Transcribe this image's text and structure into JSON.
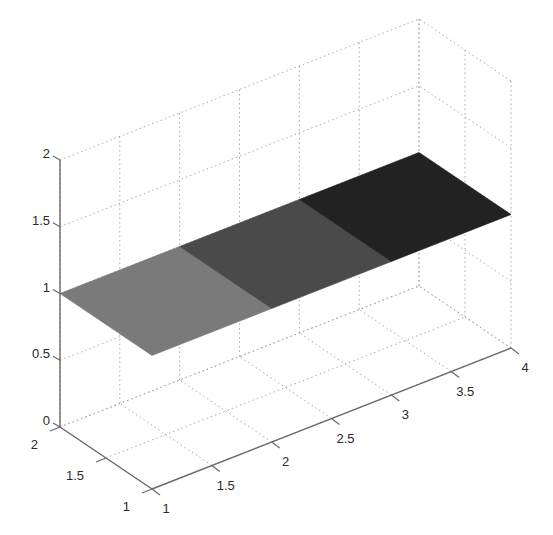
{
  "chart_data": {
    "type": "surface3d",
    "title": "",
    "xlabel": "",
    "ylabel": "",
    "zlabel": "",
    "grid": true,
    "legend": null,
    "x": [
      1,
      2,
      3,
      4
    ],
    "y": [
      1,
      2
    ],
    "z": [
      [
        1,
        1,
        1,
        1
      ],
      [
        1,
        1,
        1,
        1
      ]
    ],
    "patches": [
      {
        "x_range": [
          1,
          2
        ],
        "y_range": [
          1,
          2
        ],
        "z": 1,
        "color": "#7a7a7a"
      },
      {
        "x_range": [
          2,
          3
        ],
        "y_range": [
          1,
          2
        ],
        "z": 1,
        "color": "#4a4a4a"
      },
      {
        "x_range": [
          3,
          4
        ],
        "y_range": [
          1,
          2
        ],
        "z": 1,
        "color": "#222222"
      }
    ],
    "xlim": [
      1,
      4
    ],
    "ylim": [
      1,
      2
    ],
    "zlim": [
      0,
      2
    ],
    "x_ticks": [
      1,
      1.5,
      2,
      2.5,
      3,
      3.5,
      4
    ],
    "x_tick_labels": [
      "1",
      "1.5",
      "2",
      "2.5",
      "3",
      "3.5",
      "4"
    ],
    "y_ticks": [
      1,
      1.5,
      2
    ],
    "y_tick_labels": [
      "1",
      "1.5",
      "2"
    ],
    "z_ticks": [
      0,
      0.5,
      1,
      1.5,
      2
    ],
    "z_tick_labels": [
      "0",
      "0.5",
      "1",
      "1.5",
      "2"
    ],
    "colormap": "gray"
  }
}
